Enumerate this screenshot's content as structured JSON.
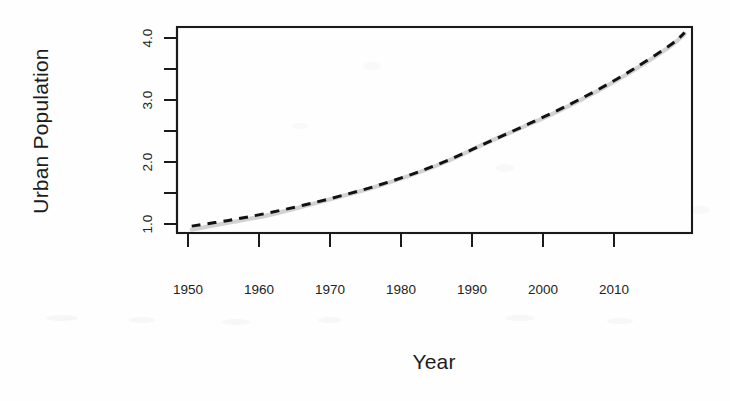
{
  "figure": {
    "background_color": "#fefefe",
    "plot_box": {
      "left": 177,
      "top": 27,
      "right": 692,
      "bottom": 233
    }
  },
  "chart_data": {
    "type": "line",
    "title": "",
    "subtitle": "",
    "xlabel": "Year",
    "ylabel": "Urban Population",
    "xlim": [
      1948,
      2018
    ],
    "ylim": [
      0.72,
      4.32
    ],
    "grid": false,
    "legend": "none",
    "x_tick_labels": [
      "1950",
      "1960",
      "1970",
      "1980",
      "1990",
      "2000",
      "2010"
    ],
    "x_ticks": [
      1950,
      1960,
      1970,
      1980,
      1990,
      2000,
      2010
    ],
    "y_ticks": [
      1.0,
      1.5,
      2.0,
      2.5,
      3.0,
      3.5,
      4.0
    ],
    "y_tick_labels": [
      "1.0",
      "",
      "2.0",
      "",
      "3.0",
      "",
      "4.0"
    ],
    "y_major_labeled": [
      "1.0",
      "2.0",
      "3.0",
      "4.0"
    ],
    "x": [
      1950,
      1955,
      1960,
      1965,
      1970,
      1975,
      1980,
      1985,
      1990,
      1995,
      2000,
      2005,
      2010,
      2015,
      2017
    ],
    "series": [
      {
        "name": "observed",
        "style": "solid",
        "color": "#d2d2d2",
        "width": 4.2,
        "values": [
          0.78,
          0.9,
          1.02,
          1.18,
          1.35,
          1.53,
          1.74,
          1.99,
          2.29,
          2.57,
          2.86,
          3.19,
          3.56,
          3.98,
          4.2
        ]
      },
      {
        "name": "fitted",
        "style": "dashed",
        "color": "#121212",
        "width": 3.0,
        "values": [
          0.84,
          0.94,
          1.06,
          1.2,
          1.36,
          1.54,
          1.75,
          2.0,
          2.29,
          2.58,
          2.88,
          3.21,
          3.58,
          4.0,
          4.22
        ]
      }
    ],
    "annotations": []
  },
  "axis": {
    "y_label_text": "Urban Population",
    "x_label_text": "Year"
  },
  "colors": {
    "axis": "#1a1a1a",
    "observed_line": "#d2d2d2",
    "fitted_line": "#121212",
    "text": "#1c1c1c",
    "background": "#fefefe"
  }
}
